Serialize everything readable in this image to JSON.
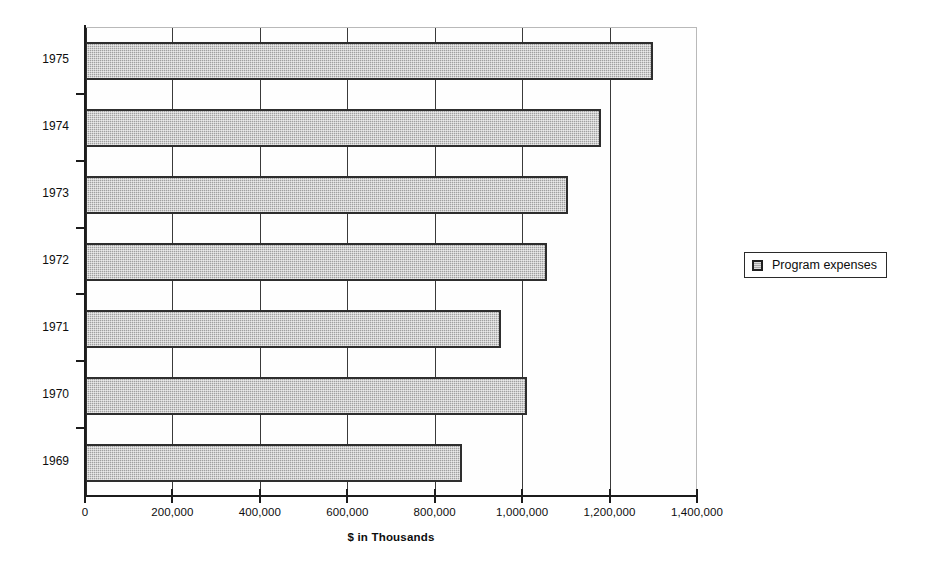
{
  "chart_data": {
    "type": "bar",
    "orientation": "horizontal",
    "title": "",
    "subtitle": "",
    "xlabel": "$ in Thousands",
    "ylabel": "",
    "categories": [
      "1975",
      "1974",
      "1973",
      "1972",
      "1971",
      "1970",
      "1969"
    ],
    "series": [
      {
        "name": "Program expenses",
        "values": [
          1300000,
          1180000,
          1105000,
          1057000,
          952000,
          1012000,
          862000
        ]
      }
    ],
    "xlim": [
      0,
      1400000
    ],
    "ylim": null,
    "x_ticks": [
      0,
      200000,
      400000,
      600000,
      800000,
      1000000,
      1200000,
      1400000
    ],
    "x_tick_labels": [
      "0",
      "200,000",
      "400,000",
      "600,000",
      "800,000",
      "1,000,000",
      "1,200,000",
      "1,400,000"
    ],
    "y_tick_labels": [
      "1975",
      "1974",
      "1973",
      "1972",
      "1971",
      "1970",
      "1969"
    ],
    "grid": "vertical",
    "legend_position": "right",
    "legend_entries": [
      "Program expenses"
    ],
    "bar_fill_color": "#a0a0a0",
    "bar_border_color": "#2e2e2e",
    "axis_color": "#1c1c1c",
    "gridline_color": "#3a3a3a"
  },
  "legend": {
    "label": "Program expenses"
  },
  "axis": {
    "x_title": "$ in Thousands"
  }
}
